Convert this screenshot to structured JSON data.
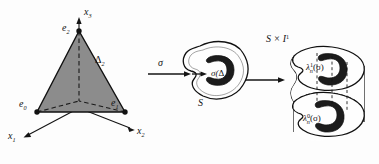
{
  "figure": {
    "panels": [
      {
        "id": "panel-simplex",
        "name": "standard-2-simplex",
        "axes": [
          {
            "name": "axis-x1",
            "label": "x",
            "sub": "1",
            "direction": "lower-left"
          },
          {
            "name": "axis-x2",
            "label": "x",
            "sub": "2",
            "direction": "lower-right"
          },
          {
            "name": "axis-x3",
            "label": "x",
            "sub": "3",
            "direction": "up"
          }
        ],
        "vertices": [
          {
            "name": "vertex-e0",
            "label": "e",
            "sub": "0"
          },
          {
            "name": "vertex-e1",
            "label": "e",
            "sub": "1"
          },
          {
            "name": "vertex-e2",
            "label": "e",
            "sub": "2"
          }
        ],
        "region_label": {
          "label": "Δ",
          "sub": "2"
        },
        "fill_color": "#8a8a8a",
        "stroke_color": "#111111"
      },
      {
        "id": "panel-space-s",
        "name": "space-s-blob",
        "map_arrow_label": "σ",
        "blob_label": "S",
        "image_label": {
          "prefix": "σ(",
          "base": "Δ",
          "sub": "2",
          "suffix": ")"
        },
        "dark_region_color": "#1c1c1c",
        "blob_fill": "#fefefe",
        "stroke_color": "#111111"
      },
      {
        "id": "panel-prism",
        "name": "prism-s-times-i",
        "prism_label": {
          "base": "S × I",
          "sup": "1"
        },
        "top_region_label": {
          "base": "λ",
          "sup": "1",
          "sub": "n",
          "arg": "(σ)"
        },
        "bottom_region_label": {
          "base": "λ",
          "sup": "0",
          "sub": "n",
          "arg": "(σ)"
        },
        "dark_region_color": "#1c1c1c",
        "blob_fill": "#fefefe",
        "stroke_color": "#111111",
        "dashed_stroke": "#111111"
      }
    ],
    "arrows": [
      {
        "name": "arrow-sigma",
        "label": "σ",
        "from": "simplex",
        "to": "space-s"
      },
      {
        "name": "arrow-inclusion",
        "label": "",
        "from": "space-s",
        "to": "prism"
      }
    ]
  }
}
